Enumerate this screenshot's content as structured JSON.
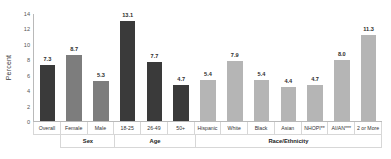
{
  "chart_data": {
    "type": "bar",
    "title": "",
    "xlabel": "",
    "ylabel": "Percent",
    "ylim": [
      0,
      14
    ],
    "yticks": [
      0,
      2,
      4,
      6,
      8,
      10,
      12,
      14
    ],
    "grid": false,
    "legend": "none",
    "categories": [
      "Overall",
      "Female",
      "Male",
      "18-25",
      "26-49",
      "50+",
      "Hispanic",
      "White",
      "Black",
      "Asian",
      "NHOPI**",
      "AI/AN***",
      "2 or More"
    ],
    "values": [
      7.3,
      8.7,
      5.3,
      13.1,
      7.7,
      4.7,
      5.4,
      7.9,
      5.4,
      4.4,
      4.7,
      8.0,
      11.3
    ],
    "value_labels": [
      "7.3",
      "8.7",
      "5.3",
      "13.1",
      "7.7",
      "4.7",
      "5.4",
      "7.9",
      "5.4",
      "4.4",
      "4.7",
      "8.0",
      "11.3"
    ],
    "bar_colors": [
      "#3a3a3a",
      "#7d7d7d",
      "#7d7d7d",
      "#3a3a3a",
      "#3a3a3a",
      "#3a3a3a",
      "#b5b5b5",
      "#b5b5b5",
      "#b5b5b5",
      "#b5b5b5",
      "#b5b5b5",
      "#b5b5b5",
      "#b5b5b5"
    ],
    "groups": [
      {
        "label": "",
        "span": 1
      },
      {
        "label": "Sex",
        "span": 2
      },
      {
        "label": "Age",
        "span": 3
      },
      {
        "label": "Race/Ethnicity",
        "span": 7
      }
    ],
    "axis_color": "#b9b9b9"
  }
}
